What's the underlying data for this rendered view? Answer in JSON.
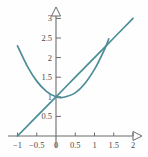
{
  "figure": {
    "label": ")",
    "axis_color": "#6b6b6b",
    "curve_color": "#4c8e97",
    "tick_label_color": "#4a4a4a",
    "background": "#fefefe"
  },
  "chart_data": {
    "type": "line",
    "title": "",
    "xlabel": "",
    "ylabel": "",
    "xlim": [
      -1.15,
      2.25
    ],
    "ylim": [
      -0.18,
      3.35
    ],
    "grid": false,
    "legend": false,
    "xticks": [
      -1,
      -0.5,
      0,
      0.5,
      1,
      1.5,
      2
    ],
    "xtick_labels": [
      "−1",
      "−0.5",
      "0",
      "0.5",
      "1",
      "1.5",
      "2"
    ],
    "yticks": [
      0.5,
      1,
      1.5,
      2,
      2.5,
      3
    ],
    "ytick_labels": [
      "0.5",
      "1",
      "1.5",
      "2",
      "2.5",
      "3"
    ],
    "axis_arrows": [
      "y-up",
      "x-right"
    ],
    "series": [
      {
        "name": "line",
        "equation": "y = x + 1",
        "x": [
          -1,
          -0.5,
          0,
          0.5,
          1,
          1.5,
          2
        ],
        "values": [
          0,
          0.5,
          1,
          1.5,
          2,
          2.5,
          3
        ]
      },
      {
        "name": "parabola",
        "equation": "y = x^2 - 0.3x + 1",
        "x": [
          -1,
          -0.75,
          -0.5,
          -0.25,
          0,
          0.15,
          0.25,
          0.5,
          0.75,
          1,
          1.15,
          1.3,
          1.37
        ],
        "values": [
          2.3,
          1.79,
          1.4,
          1.14,
          1,
          0.98,
          1.0,
          1.1,
          1.34,
          1.7,
          1.98,
          2.3,
          2.48
        ]
      }
    ],
    "intersections": [
      {
        "x": 0,
        "y": 1
      },
      {
        "x": 1,
        "y": 2
      }
    ]
  }
}
